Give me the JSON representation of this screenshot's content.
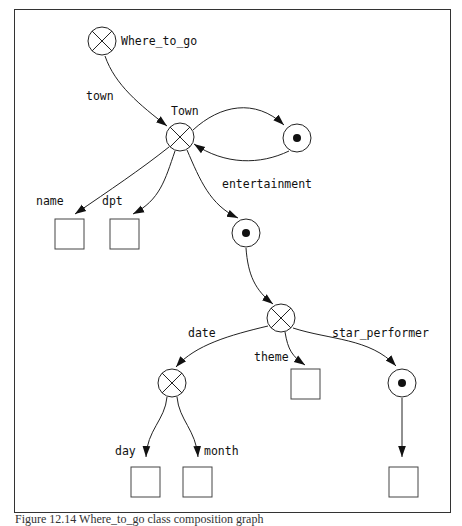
{
  "figure": {
    "caption": "Figure 12.14 Where_to_go class composition graph"
  },
  "nodes": {
    "where_to_go": {
      "label": "Where_to_go",
      "kind": "composite"
    },
    "town": {
      "label": "Town",
      "kind": "composite"
    },
    "town_self": {
      "label": "",
      "kind": "reference"
    },
    "entertainment_ref": {
      "label": "",
      "kind": "reference"
    },
    "entertainment": {
      "label": "",
      "kind": "composite"
    },
    "date": {
      "label": "",
      "kind": "composite"
    },
    "star_ref": {
      "label": "",
      "kind": "reference"
    }
  },
  "edges": {
    "town": "town",
    "name": "name",
    "dpt": "dpt",
    "entertainment": "entertainment",
    "date": "date",
    "theme": "theme",
    "star_performer": "star_performer",
    "day": "day",
    "month": "month"
  },
  "legend": {
    "composite_symbol": "circle-with-x",
    "reference_symbol": "circle-with-dot",
    "atomic_symbol": "square"
  }
}
